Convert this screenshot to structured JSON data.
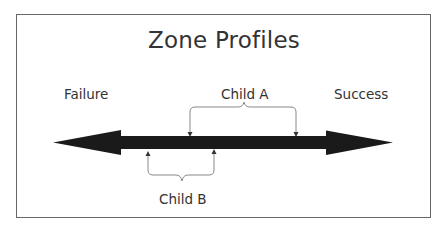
{
  "diagram": {
    "title": "Zone Profiles",
    "axis": {
      "left_label": "Failure",
      "right_label": "Success",
      "type": "double-headed-arrow",
      "color": "#1a1a1a"
    },
    "ranges": [
      {
        "label": "Child A",
        "position": "above-axis",
        "start_x": 190,
        "end_x": 296
      },
      {
        "label": "Child B",
        "position": "below-axis",
        "start_x": 148,
        "end_x": 214
      }
    ],
    "colors": {
      "text": "#333333",
      "frame": "#666666",
      "axis": "#1a1a1a",
      "brace": "#888888"
    }
  }
}
